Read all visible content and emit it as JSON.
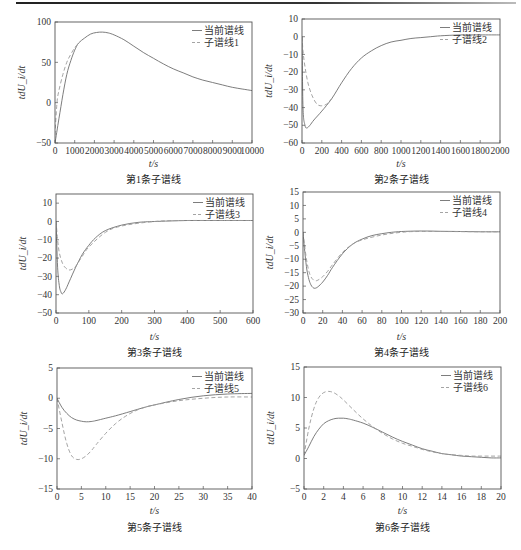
{
  "figure": {
    "legend_current": "当前谱线",
    "ylabel": "tdU_i/dt",
    "xlabel": "t/s"
  },
  "chart_data": [
    {
      "type": "line",
      "caption": "第1条子谱线",
      "xlabel": "t/s",
      "ylabel": "tdU_i/dt",
      "xlim": [
        0,
        10000
      ],
      "ylim": [
        -50,
        100
      ],
      "xticks": [
        0,
        1000,
        2000,
        3000,
        4000,
        5000,
        6000,
        7000,
        8000,
        9000,
        10000
      ],
      "yticks": [
        -50,
        0,
        50,
        100
      ],
      "legend_position": "upper right",
      "grid": false,
      "series": [
        {
          "name": "当前谱线",
          "style": "solid",
          "x": [
            0,
            200,
            400,
            600,
            800,
            1000,
            1200,
            1500,
            1800,
            2100,
            2400,
            2700,
            3000,
            3500,
            4000,
            4500,
            5000,
            5500,
            6000,
            6500,
            7000,
            7500,
            8000,
            8500,
            9000,
            9500,
            10000
          ],
          "y": [
            -50,
            -20,
            10,
            35,
            52,
            65,
            74,
            80,
            85,
            87,
            87.5,
            86.5,
            84,
            78,
            70,
            62,
            55,
            48,
            42,
            37,
            32,
            28,
            25,
            22,
            19,
            17,
            15
          ]
        },
        {
          "name": "子谱线1",
          "style": "dashed",
          "x": [
            0,
            100,
            200,
            400,
            600,
            800,
            1000,
            1200
          ],
          "y": [
            -40,
            0,
            15,
            35,
            50,
            60,
            68,
            74
          ]
        }
      ]
    },
    {
      "type": "line",
      "caption": "第2条子谱线",
      "xlabel": "t/s",
      "ylabel": "tdU_i/dt",
      "xlim": [
        0,
        2000
      ],
      "ylim": [
        -60,
        10
      ],
      "xticks": [
        0,
        200,
        400,
        600,
        800,
        1000,
        1200,
        1400,
        1600,
        1800,
        2000
      ],
      "yticks": [
        -60,
        -50,
        -40,
        -30,
        -20,
        -10,
        0,
        10
      ],
      "legend_position": "upper right",
      "grid": false,
      "series": [
        {
          "name": "当前谱线",
          "style": "solid",
          "x": [
            0,
            10,
            30,
            50,
            80,
            120,
            200,
            300,
            400,
            500,
            600,
            700,
            800,
            900,
            1000,
            1100,
            1200,
            1300,
            1400,
            1600,
            1800,
            2000
          ],
          "y": [
            0,
            -40,
            -50,
            -51.5,
            -50,
            -47,
            -42,
            -35,
            -26,
            -18,
            -12,
            -8,
            -5,
            -3,
            -2,
            -1,
            -0.5,
            0,
            0.5,
            1,
            1,
            1
          ]
        },
        {
          "name": "子谱线2",
          "style": "dashed",
          "x": [
            0,
            10,
            30,
            60,
            100,
            150,
            200,
            250,
            300
          ],
          "y": [
            0,
            -8,
            -17,
            -26,
            -33,
            -38,
            -39,
            -38,
            -35
          ]
        }
      ]
    },
    {
      "type": "line",
      "caption": "第3条子谱线",
      "xlabel": "t/s",
      "ylabel": "tdU_i/dt",
      "xlim": [
        0,
        600
      ],
      "ylim": [
        -50,
        15
      ],
      "xticks": [
        0,
        100,
        200,
        300,
        400,
        500,
        600
      ],
      "yticks": [
        -50,
        -40,
        -30,
        -20,
        -10,
        0,
        10
      ],
      "legend_position": "upper right",
      "grid": false,
      "series": [
        {
          "name": "当前谱线",
          "style": "solid",
          "x": [
            0,
            5,
            10,
            15,
            20,
            30,
            40,
            60,
            80,
            100,
            120,
            150,
            200,
            250,
            300,
            400,
            500,
            600
          ],
          "y": [
            0,
            -25,
            -35,
            -38.5,
            -39.5,
            -37,
            -33,
            -25,
            -18,
            -13,
            -9,
            -5,
            -2,
            -0.5,
            0,
            0.5,
            0.5,
            0.5
          ]
        },
        {
          "name": "子谱线3",
          "style": "dashed",
          "x": [
            0,
            5,
            10,
            20,
            30,
            40,
            50,
            60,
            80,
            100,
            150,
            200,
            300,
            400,
            600
          ],
          "y": [
            0,
            -10,
            -17,
            -23,
            -25.5,
            -26.5,
            -26,
            -24.5,
            -19,
            -14,
            -6,
            -2.5,
            0,
            0.5,
            0.5
          ]
        }
      ]
    },
    {
      "type": "line",
      "caption": "第4条子谱线",
      "xlabel": "t/s",
      "ylabel": "tdU_i/dt",
      "xlim": [
        0,
        200
      ],
      "ylim": [
        -30,
        15
      ],
      "xticks": [
        0,
        20,
        40,
        60,
        80,
        100,
        120,
        140,
        160,
        180,
        200
      ],
      "yticks": [
        -30,
        -25,
        -20,
        -15,
        -10,
        -5,
        0,
        5,
        10,
        15
      ],
      "legend_position": "upper right",
      "grid": false,
      "series": [
        {
          "name": "当前谱线",
          "style": "solid",
          "x": [
            0,
            2,
            4,
            6,
            8,
            10,
            12,
            15,
            20,
            25,
            30,
            40,
            50,
            60,
            70,
            80,
            90,
            100,
            120,
            140,
            160,
            180,
            200
          ],
          "y": [
            0,
            -8,
            -14,
            -17.5,
            -19.5,
            -20.5,
            -20.8,
            -20.3,
            -18.5,
            -16,
            -13,
            -8,
            -4.5,
            -2.5,
            -1.2,
            -0.5,
            0,
            0.3,
            0.5,
            0.4,
            0.3,
            0.2,
            0.2
          ]
        },
        {
          "name": "子谱线4",
          "style": "dashed",
          "x": [
            0,
            2,
            4,
            6,
            8,
            10,
            12,
            15,
            20,
            25,
            30,
            40,
            50,
            60,
            80,
            100,
            120,
            200
          ],
          "y": [
            0,
            -6,
            -11,
            -14.5,
            -16.5,
            -17.5,
            -18,
            -17.8,
            -16.5,
            -14.5,
            -12,
            -7.5,
            -4.5,
            -2.8,
            -1,
            0,
            0.3,
            0.2
          ]
        }
      ]
    },
    {
      "type": "line",
      "caption": "第5条子谱线",
      "xlabel": "t/s",
      "ylabel": "tdU_i/dt",
      "xlim": [
        0,
        40
      ],
      "ylim": [
        -15,
        5
      ],
      "xticks": [
        0,
        5,
        10,
        15,
        20,
        25,
        30,
        35,
        40
      ],
      "yticks": [
        -15,
        -10,
        -5,
        0,
        5
      ],
      "legend_position": "upper right",
      "grid": false,
      "series": [
        {
          "name": "当前谱线",
          "style": "solid",
          "x": [
            0,
            1,
            2,
            3,
            4,
            5,
            6,
            7,
            8,
            10,
            12,
            15,
            18,
            20,
            25,
            30,
            35,
            40
          ],
          "y": [
            0,
            -1.5,
            -2.5,
            -3.2,
            -3.6,
            -3.8,
            -3.9,
            -3.85,
            -3.7,
            -3.3,
            -2.9,
            -2.2,
            -1.5,
            -1.1,
            -0.2,
            0.4,
            0.7,
            0.8
          ]
        },
        {
          "name": "子谱线5",
          "style": "dashed",
          "x": [
            0,
            1,
            2,
            3,
            4,
            5,
            6,
            7,
            8,
            10,
            12,
            14,
            16,
            18,
            20,
            25,
            30,
            35,
            40
          ],
          "y": [
            0,
            -4,
            -7.5,
            -9.5,
            -10.1,
            -10,
            -9.5,
            -8.7,
            -7.7,
            -5.8,
            -4.2,
            -3,
            -2.1,
            -1.5,
            -1.1,
            -0.4,
            0,
            0.2,
            0.2
          ]
        }
      ]
    },
    {
      "type": "line",
      "caption": "第6条子谱线",
      "xlabel": "t/s",
      "ylabel": "tdU_i/dt",
      "xlim": [
        0,
        20
      ],
      "ylim": [
        -5,
        15
      ],
      "xticks": [
        0,
        2,
        4,
        6,
        8,
        10,
        12,
        14,
        16,
        18,
        20
      ],
      "yticks": [
        -5,
        0,
        5,
        10,
        15
      ],
      "legend_position": "upper right",
      "grid": false,
      "series": [
        {
          "name": "当前谱线",
          "style": "solid",
          "x": [
            0,
            0.5,
            1,
            1.5,
            2,
            2.5,
            3,
            3.5,
            4,
            4.5,
            5,
            6,
            7,
            8,
            9,
            10,
            11,
            12,
            13,
            14,
            15,
            16,
            17,
            18,
            19,
            20
          ],
          "y": [
            0.5,
            2,
            3.6,
            4.8,
            5.7,
            6.2,
            6.5,
            6.6,
            6.6,
            6.5,
            6.3,
            5.8,
            5.1,
            4.3,
            3.5,
            2.8,
            2.2,
            1.6,
            1.2,
            0.8,
            0.6,
            0.4,
            0.3,
            0.2,
            0.1,
            0.1
          ]
        },
        {
          "name": "子谱线6",
          "style": "dashed",
          "x": [
            0,
            0.5,
            1,
            1.5,
            2,
            2.5,
            3,
            3.5,
            4,
            5,
            6,
            7,
            8,
            9,
            10,
            11,
            12,
            13,
            14,
            15,
            16,
            17,
            18,
            19,
            20
          ],
          "y": [
            0.5,
            5,
            8.2,
            10,
            10.8,
            11,
            10.8,
            10.3,
            9.6,
            8,
            6.5,
            5.2,
            4.1,
            3.2,
            2.5,
            2,
            1.5,
            1.1,
            0.8,
            0.6,
            0.5,
            0.4,
            0.4,
            0.4,
            0.4
          ]
        }
      ]
    }
  ],
  "layout": {
    "panels": [
      {
        "left": 55,
        "top": 22,
        "right": 252,
        "bottom": 143,
        "caption_y": 183,
        "xlabel_y": 167,
        "tick_fs": 8.6
      },
      {
        "left": 302,
        "top": 19,
        "right": 500,
        "bottom": 143,
        "caption_y": 183,
        "xlabel_y": 167,
        "tick_fs": 8.6
      },
      {
        "left": 56,
        "top": 194,
        "right": 253,
        "bottom": 313,
        "caption_y": 356,
        "xlabel_y": 340,
        "tick_fs": 9.2
      },
      {
        "left": 303,
        "top": 192,
        "right": 500,
        "bottom": 313,
        "caption_y": 356,
        "xlabel_y": 340,
        "tick_fs": 9.2
      },
      {
        "left": 57,
        "top": 368,
        "right": 252,
        "bottom": 489,
        "caption_y": 531,
        "xlabel_y": 514,
        "tick_fs": 9.2
      },
      {
        "left": 304,
        "top": 367,
        "right": 501,
        "bottom": 489,
        "caption_y": 531,
        "xlabel_y": 514,
        "tick_fs": 9.2
      }
    ]
  }
}
